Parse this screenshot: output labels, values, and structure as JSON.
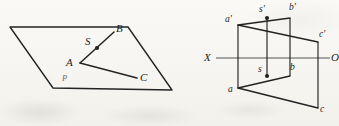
{
  "figure": {
    "background_color": "#f7f6f3",
    "ink_color": "#232323",
    "axis_color": "#555555"
  },
  "left_diagram": {
    "name": "pictorial-view",
    "plane_label": "P",
    "plane_corners": [
      {
        "x": 10,
        "y": 27
      },
      {
        "x": 128,
        "y": 27
      },
      {
        "x": 172,
        "y": 90
      },
      {
        "x": 53,
        "y": 88
      }
    ],
    "points": [
      {
        "id": "A",
        "label": "A",
        "x": 80,
        "y": 63,
        "label_x": 68,
        "label_y": 58
      },
      {
        "id": "B",
        "label": "B",
        "x": 114,
        "y": 32,
        "label_x": 116,
        "label_y": 24
      },
      {
        "id": "C",
        "label": "C",
        "x": 137,
        "y": 78,
        "label_x": 140,
        "label_y": 74
      },
      {
        "id": "S",
        "label": "S",
        "x": 97,
        "y": 48,
        "label_x": 85,
        "label_y": 37
      }
    ],
    "segments": [
      {
        "from": "A",
        "to": "B"
      },
      {
        "from": "A",
        "to": "C"
      }
    ]
  },
  "right_diagram": {
    "name": "orthographic-projection-view",
    "axis": {
      "left_label": "X",
      "right_label": "O",
      "y": 58,
      "x_start": 218,
      "x_end": 330,
      "left_label_x": 205,
      "left_label_y": 53,
      "right_label_x": 331,
      "right_label_y": 53
    },
    "front_view_points": [
      {
        "id": "a_prime",
        "label": "a'",
        "x": 238,
        "y": 25,
        "label_x": 226,
        "label_y": 18
      },
      {
        "id": "s_prime",
        "label": "s'",
        "x": 267,
        "y": 18,
        "label_x": 259,
        "label_y": 7
      },
      {
        "id": "b_prime",
        "label": "b'",
        "x": 290,
        "y": 18,
        "label_x": 290,
        "label_y": 5
      },
      {
        "id": "c_prime",
        "label": "c'",
        "x": 318,
        "y": 42,
        "label_x": 319,
        "label_y": 32
      }
    ],
    "top_view_points": [
      {
        "id": "a",
        "label": "a",
        "x": 238,
        "y": 88,
        "label_x": 228,
        "label_y": 87
      },
      {
        "id": "s",
        "label": "s",
        "x": 267,
        "y": 76,
        "label_x": 259,
        "label_y": 67
      },
      {
        "id": "b",
        "label": "b",
        "x": 290,
        "y": 76,
        "label_x": 291,
        "label_y": 65
      },
      {
        "id": "c",
        "label": "c",
        "x": 318,
        "y": 108,
        "label_x": 320,
        "label_y": 108
      }
    ],
    "front_view_segments": [
      {
        "from": "a_prime",
        "to": "b_prime"
      },
      {
        "from": "a_prime",
        "to": "c_prime"
      }
    ],
    "top_view_segments": [
      {
        "from": "a",
        "to": "b"
      },
      {
        "from": "a",
        "to": "c"
      }
    ],
    "projection_lines": [
      {
        "id": "proj-a",
        "x": 238,
        "y_top": 25,
        "y_bottom": 88
      },
      {
        "id": "proj-s",
        "x": 267,
        "y_top": 18,
        "y_bottom": 76
      },
      {
        "id": "proj-b",
        "x": 290,
        "y_top": 18,
        "y_bottom": 76
      },
      {
        "id": "proj-c",
        "x": 318,
        "y_top": 42,
        "y_bottom": 108
      }
    ]
  },
  "artifacts": {
    "bleed_text_1": "",
    "bleed_text_2": ""
  }
}
